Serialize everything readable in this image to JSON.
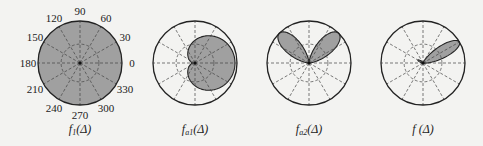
{
  "figure": {
    "angle_labels": [
      "0",
      "30",
      "60",
      "90",
      "120",
      "150",
      "180",
      "210",
      "240",
      "270",
      "300",
      "330"
    ],
    "fill_color": "#a0a0a0",
    "line_color": "#222222",
    "background": "#f3f3f1",
    "panels": [
      {
        "id": "p1",
        "cx": 80,
        "cy": 63,
        "r": 42,
        "caption_main": "f",
        "caption_sub": "1",
        "caption_arg": "(Δ)",
        "pattern": "omni"
      },
      {
        "id": "p2",
        "cx": 195,
        "cy": 63,
        "r": 42,
        "caption_main": "f",
        "caption_sub": "a1",
        "caption_arg": "(Δ)",
        "pattern": "cardioid"
      },
      {
        "id": "p3",
        "cx": 309,
        "cy": 63,
        "r": 42,
        "caption_main": "f",
        "caption_sub": "a2",
        "caption_arg": "(Δ)",
        "pattern": "two-lobes"
      },
      {
        "id": "p4",
        "cx": 423,
        "cy": 63,
        "r": 42,
        "caption_main": "f",
        "caption_sub": "",
        "caption_arg": " (Δ)",
        "pattern": "single-lobe"
      }
    ]
  },
  "chart_data": {
    "type": "polar",
    "title": "",
    "angle_ticks_deg": [
      0,
      30,
      60,
      90,
      120,
      150,
      180,
      210,
      240,
      270,
      300,
      330
    ],
    "radial_grid": [
      0.5,
      1.0
    ],
    "grid": true,
    "panels": [
      {
        "name": "f1(Δ)",
        "description": "omnidirectional, full unit circle filled",
        "max_direction_deg": null
      },
      {
        "name": "fa1(Δ)",
        "description": "cardioid pattern facing 0°",
        "max_direction_deg": 0
      },
      {
        "name": "fa2(Δ)",
        "description": "two lobes at about 30° and 150°",
        "max_direction_deg": [
          30,
          150
        ]
      },
      {
        "name": "f(Δ)",
        "description": "main lobe at about 30°, small back lobe near 150°",
        "max_direction_deg": 30
      }
    ]
  }
}
